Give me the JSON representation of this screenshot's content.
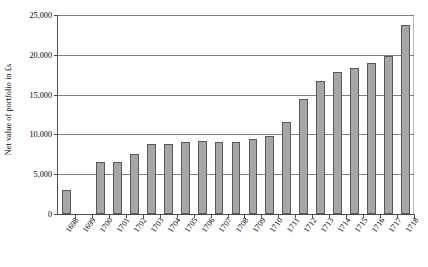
{
  "chart_data": {
    "type": "bar",
    "title": "",
    "xlabel": "",
    "ylabel": "Net value of portfolio in £s",
    "ylim": [
      0,
      25000
    ],
    "ytick_labels": [
      "0",
      "5,000",
      "10,000",
      "15,000",
      "20,000",
      "25,000"
    ],
    "ytick_values": [
      0,
      5000,
      10000,
      15000,
      20000,
      25000
    ],
    "grid": true,
    "legend": "none",
    "categories": [
      "1698",
      "1699",
      "1700",
      "1701",
      "1702",
      "1703",
      "1704",
      "1705",
      "1706",
      "1707",
      "1708",
      "1709",
      "1710",
      "1711",
      "1712",
      "1713",
      "1714",
      "1715",
      "1716",
      "1717",
      "1718"
    ],
    "values": [
      3000,
      0,
      6500,
      6500,
      7500,
      8800,
      8800,
      9100,
      9200,
      9100,
      9100,
      9400,
      9800,
      11500,
      14500,
      16700,
      17800,
      18300,
      19000,
      19800,
      23700
    ],
    "bar_color": "#a6a6a6",
    "bar_border_color": "#595959",
    "gridline_color": "#808080",
    "axis_color": "#4d4d4d"
  }
}
